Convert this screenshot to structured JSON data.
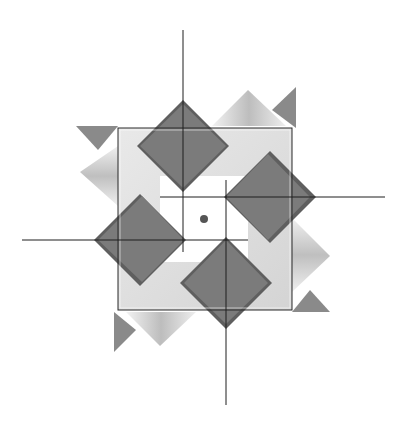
{
  "figure": {
    "type": "geometric-pinwheel-diagram",
    "background": "#ffffff",
    "colors": {
      "diamond_fill": "#7a7a7a",
      "diamond_shadow": "#5e5e5e",
      "panel_light": "#e6e6e6",
      "panel_mid": "#c8c8c8",
      "panel_dark": "#9a9a9a",
      "frame_stroke": "#2a2a2a",
      "axis_stroke": "#1e1e1e",
      "center_dot": "#555555"
    },
    "frame": {
      "x": 118,
      "y": 128,
      "width": 174,
      "height": 182
    },
    "center_dot": {
      "cx": 204,
      "cy": 219,
      "r": 4
    },
    "diamonds": [
      {
        "name": "top",
        "cx": 183,
        "cy": 146,
        "r": 44
      },
      {
        "name": "right",
        "cx": 270,
        "cy": 197,
        "r": 44
      },
      {
        "name": "bottom",
        "cx": 226,
        "cy": 283,
        "r": 44
      },
      {
        "name": "left",
        "cx": 140,
        "cy": 240,
        "r": 44
      }
    ],
    "axis_lines": [
      {
        "name": "vertical-top",
        "x1": 183,
        "y1": 30,
        "x2": 183,
        "y2": 252
      },
      {
        "name": "vertical-bottom",
        "x1": 226,
        "y1": 180,
        "x2": 226,
        "y2": 405
      },
      {
        "name": "horizontal-left",
        "x1": 22,
        "y1": 240,
        "x2": 248,
        "y2": 240
      },
      {
        "name": "horizontal-right",
        "x1": 160,
        "y1": 197,
        "x2": 385,
        "y2": 197
      }
    ]
  }
}
